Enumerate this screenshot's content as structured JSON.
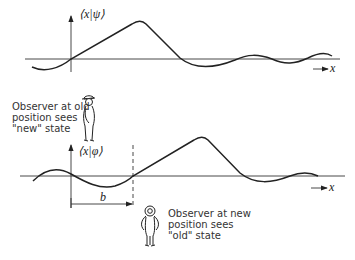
{
  "top_plot": {
    "ylabel": "⟨x|ψ⟩",
    "xlabel": "x"
  },
  "bottom_plot": {
    "ylabel": "⟨x|φ⟩",
    "xlabel": "x",
    "shift_label": "b"
  },
  "observer_old": {
    "lines": [
      "Observer at old",
      "position sees",
      "\"new\" state"
    ]
  },
  "observer_new": {
    "lines": [
      "Observer at new",
      "position sees",
      "\"old\" state"
    ]
  },
  "colors": {
    "ink": "#222222",
    "background": "#ffffff"
  }
}
